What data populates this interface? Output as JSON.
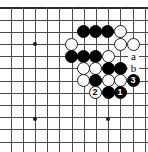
{
  "diagram": {
    "type": "go-board-diagram",
    "board_size": 19,
    "view": {
      "origin_x": 35,
      "origin_y": 44,
      "spacing": 12.2,
      "cols_visible": 9,
      "rows_visible": 10,
      "edge_top": true,
      "edge_left": true,
      "background_color": "#ffffff",
      "line_color": "#4a4a4a",
      "edge_color": "#2b2b2b"
    },
    "hoshi": [
      {
        "x": 35,
        "y": 44
      },
      {
        "x": 35,
        "y": 119
      },
      {
        "x": 108,
        "y": 119
      }
    ],
    "stones": [
      {
        "color": "black",
        "x": 83,
        "y": 31
      },
      {
        "color": "black",
        "x": 95,
        "y": 31
      },
      {
        "color": "black",
        "x": 107,
        "y": 31
      },
      {
        "color": "white",
        "x": 120,
        "y": 31
      },
      {
        "color": "white",
        "x": 71,
        "y": 44
      },
      {
        "color": "white",
        "x": 120,
        "y": 44
      },
      {
        "color": "white",
        "x": 133,
        "y": 44
      },
      {
        "color": "black",
        "x": 71,
        "y": 56
      },
      {
        "color": "black",
        "x": 83,
        "y": 56
      },
      {
        "color": "black",
        "x": 95,
        "y": 56
      },
      {
        "color": "white",
        "x": 108,
        "y": 56
      },
      {
        "color": "white",
        "x": 83,
        "y": 68
      },
      {
        "color": "white",
        "x": 95,
        "y": 68
      },
      {
        "color": "black",
        "x": 108,
        "y": 68
      },
      {
        "color": "black",
        "x": 120,
        "y": 68
      },
      {
        "color": "white",
        "x": 83,
        "y": 80
      },
      {
        "color": "black",
        "x": 95,
        "y": 80
      },
      {
        "color": "white",
        "x": 108,
        "y": 80
      },
      {
        "color": "white",
        "x": 120,
        "y": 80
      },
      {
        "color": "black",
        "x": 108,
        "y": 92
      }
    ],
    "move_markers": [
      {
        "label": "1",
        "color": "black",
        "x": 120,
        "y": 92
      },
      {
        "label": "2",
        "color": "white",
        "x": 95,
        "y": 92
      },
      {
        "label": "3",
        "color": "black",
        "x": 133,
        "y": 80
      }
    ],
    "letter_labels": [
      {
        "label": "a",
        "x": 133,
        "y": 56
      },
      {
        "label": "b",
        "x": 133,
        "y": 68
      }
    ]
  }
}
